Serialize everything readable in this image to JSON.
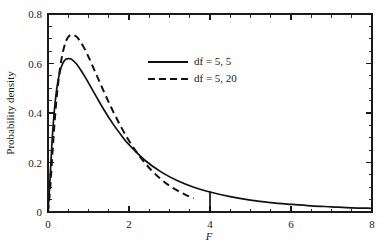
{
  "chart_data": {
    "type": "line",
    "title": "",
    "subtitle": "",
    "xlabel": "F",
    "ylabel": "Probability density",
    "xlim": [
      0,
      8
    ],
    "ylim": [
      0,
      0.8
    ],
    "grid": false,
    "legend_position": "upper-center",
    "x_ticks_major": [
      0,
      2,
      4,
      6,
      8
    ],
    "x_tick_labels": [
      "0",
      "2",
      "4",
      "6",
      "8"
    ],
    "x_tick_minor_step": 0.5,
    "y_ticks_major": [
      0,
      0.2,
      0.4,
      0.6,
      0.8
    ],
    "y_tick_labels": [
      "0",
      "0.2",
      "0.4",
      "0.6",
      "0.8"
    ],
    "y_tick_minor_step": 0.05,
    "series": [
      {
        "name": "df = 5, 5",
        "style": "solid",
        "color": "#111111",
        "df1": 5,
        "df2": 5,
        "x_end": 8.0,
        "peak_x": 0.5,
        "peak_y": 0.635,
        "x": [
          0.0,
          0.05,
          0.1,
          0.15,
          0.2,
          0.25,
          0.3,
          0.35,
          0.4,
          0.45,
          0.5,
          0.55,
          0.6,
          0.7,
          0.8,
          0.9,
          1.0,
          1.2,
          1.4,
          1.6,
          1.8,
          2.0,
          2.4,
          2.8,
          3.2,
          3.6,
          4.0,
          4.5,
          5.0,
          5.5,
          6.0,
          6.5,
          7.0,
          7.5,
          8.0
        ],
        "values": [
          0.0,
          0.133,
          0.285,
          0.398,
          0.478,
          0.533,
          0.57,
          0.595,
          0.61,
          0.618,
          0.62,
          0.619,
          0.615,
          0.599,
          0.576,
          0.55,
          0.522,
          0.464,
          0.408,
          0.357,
          0.312,
          0.272,
          0.208,
          0.161,
          0.126,
          0.1,
          0.081,
          0.062,
          0.048,
          0.038,
          0.031,
          0.025,
          0.021,
          0.017,
          0.015
        ]
      },
      {
        "name": "df = 5, 20",
        "style": "dashed",
        "color": "#111111",
        "df1": 5,
        "df2": 20,
        "x_end": 3.6,
        "peak_x": 0.56,
        "peak_y": 0.72,
        "x": [
          0.0,
          0.05,
          0.1,
          0.15,
          0.2,
          0.25,
          0.3,
          0.35,
          0.4,
          0.45,
          0.5,
          0.55,
          0.6,
          0.7,
          0.8,
          0.9,
          1.0,
          1.2,
          1.4,
          1.6,
          1.8,
          2.0,
          2.2,
          2.4,
          2.6,
          2.8,
          3.0,
          3.2,
          3.4,
          3.6
        ],
        "values": [
          0.0,
          0.087,
          0.213,
          0.334,
          0.437,
          0.52,
          0.584,
          0.633,
          0.668,
          0.692,
          0.707,
          0.715,
          0.717,
          0.709,
          0.688,
          0.66,
          0.627,
          0.553,
          0.479,
          0.409,
          0.345,
          0.288,
          0.239,
          0.197,
          0.161,
          0.131,
          0.106,
          0.086,
          0.069,
          0.055
        ]
      }
    ]
  },
  "legend": {
    "entries": [
      {
        "label": "df = 5, 5",
        "style": "solid"
      },
      {
        "label": "df = 5, 20",
        "style": "dashed"
      }
    ]
  }
}
